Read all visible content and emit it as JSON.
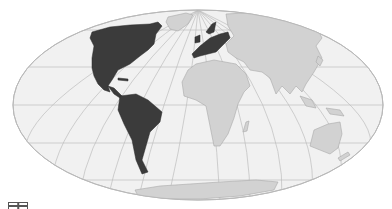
{
  "map": {
    "projection": "Mollweide (oval world map)",
    "colors": {
      "background": "#ffffff",
      "ocean": "#f1f1f1",
      "ocean_edge": "#b9b9b9",
      "graticule": "#bdbdbd",
      "land": "#d2d2d2",
      "land_edge": "#a9a9a9",
      "highlight": "#3b3b3b"
    },
    "highlighted_regions": [
      "North America",
      "Central America",
      "Caribbean",
      "South America",
      "Europe"
    ],
    "other_regions": [
      "Greenland",
      "Africa",
      "Asia",
      "Madagascar",
      "Australia",
      "New Zealand",
      "Antarctica",
      "Indonesia",
      "New Guinea",
      "Japan"
    ]
  },
  "corner_icon": {
    "name": "partially-visible-icon"
  }
}
